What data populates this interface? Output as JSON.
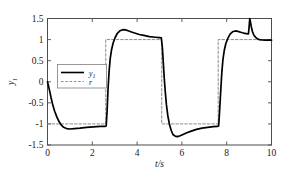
{
  "chart_data": {
    "type": "line",
    "title": "",
    "xlabel": "t/s",
    "ylabel": "y1",
    "xlim": [
      0,
      10
    ],
    "ylim": [
      -1.5,
      1.5
    ],
    "xticks": [
      "0",
      "2",
      "4",
      "6",
      "8",
      "10"
    ],
    "xtick_values": [
      0,
      2,
      4,
      6,
      8,
      10
    ],
    "yticks": [
      "1.5",
      "1",
      "0.5",
      "0",
      "-0.5",
      "-1",
      "-1.5"
    ],
    "ytick_values": [
      1.5,
      1,
      0.5,
      0,
      -0.5,
      -1,
      -1.5
    ],
    "grid": false,
    "legend_position": "center-left",
    "legend": [
      {
        "name": "y1",
        "style": "solid",
        "color": "#000000"
      },
      {
        "name": "r",
        "style": "dashed",
        "color": "#808080"
      }
    ],
    "series": [
      {
        "name": "y1",
        "style": "solid",
        "color": "#000000",
        "points": [
          [
            0.0,
            0.0
          ],
          [
            0.08,
            -0.18
          ],
          [
            0.16,
            -0.38
          ],
          [
            0.24,
            -0.56
          ],
          [
            0.32,
            -0.7
          ],
          [
            0.42,
            -0.84
          ],
          [
            0.52,
            -0.95
          ],
          [
            0.62,
            -1.03
          ],
          [
            0.72,
            -1.08
          ],
          [
            0.85,
            -1.11
          ],
          [
            1.0,
            -1.12
          ],
          [
            1.2,
            -1.11
          ],
          [
            1.45,
            -1.1
          ],
          [
            1.75,
            -1.08
          ],
          [
            2.05,
            -1.07
          ],
          [
            2.35,
            -1.06
          ],
          [
            2.56,
            -1.06
          ],
          [
            2.62,
            -1.05
          ],
          [
            2.66,
            -0.7
          ],
          [
            2.7,
            -0.2
          ],
          [
            2.75,
            0.25
          ],
          [
            2.8,
            0.55
          ],
          [
            2.86,
            0.76
          ],
          [
            2.93,
            0.92
          ],
          [
            3.02,
            1.05
          ],
          [
            3.12,
            1.15
          ],
          [
            3.24,
            1.21
          ],
          [
            3.36,
            1.235
          ],
          [
            3.48,
            1.23
          ],
          [
            3.6,
            1.21
          ],
          [
            3.75,
            1.18
          ],
          [
            3.92,
            1.15
          ],
          [
            4.1,
            1.12
          ],
          [
            4.3,
            1.1
          ],
          [
            4.55,
            1.07
          ],
          [
            4.8,
            1.055
          ],
          [
            5.0,
            1.045
          ],
          [
            5.08,
            1.04
          ],
          [
            5.13,
            0.8
          ],
          [
            5.17,
            0.45
          ],
          [
            5.21,
            0.1
          ],
          [
            5.26,
            -0.25
          ],
          [
            5.31,
            -0.55
          ],
          [
            5.37,
            -0.8
          ],
          [
            5.44,
            -1.0
          ],
          [
            5.52,
            -1.15
          ],
          [
            5.6,
            -1.25
          ],
          [
            5.7,
            -1.29
          ],
          [
            5.8,
            -1.3
          ],
          [
            5.92,
            -1.28
          ],
          [
            6.05,
            -1.25
          ],
          [
            6.22,
            -1.21
          ],
          [
            6.42,
            -1.17
          ],
          [
            6.65,
            -1.13
          ],
          [
            6.9,
            -1.1
          ],
          [
            7.15,
            -1.08
          ],
          [
            7.4,
            -1.065
          ],
          [
            7.58,
            -1.06
          ],
          [
            7.64,
            -1.05
          ],
          [
            7.68,
            -0.72
          ],
          [
            7.73,
            -0.25
          ],
          [
            7.78,
            0.2
          ],
          [
            7.83,
            0.52
          ],
          [
            7.89,
            0.74
          ],
          [
            7.96,
            0.9
          ],
          [
            8.05,
            1.03
          ],
          [
            8.15,
            1.13
          ],
          [
            8.26,
            1.185
          ],
          [
            8.38,
            1.205
          ],
          [
            8.5,
            1.195
          ],
          [
            8.62,
            1.175
          ],
          [
            8.75,
            1.155
          ],
          [
            8.88,
            1.14
          ],
          [
            8.97,
            1.135
          ],
          [
            9.0,
            1.3
          ],
          [
            9.03,
            1.5
          ],
          [
            9.06,
            1.42
          ],
          [
            9.1,
            1.3
          ],
          [
            9.15,
            1.19
          ],
          [
            9.21,
            1.11
          ],
          [
            9.28,
            1.06
          ],
          [
            9.36,
            1.02
          ],
          [
            9.46,
            1.0
          ],
          [
            9.58,
            0.99
          ],
          [
            9.72,
            0.985
          ],
          [
            9.86,
            0.985
          ],
          [
            10.0,
            0.985
          ]
        ]
      },
      {
        "name": "r",
        "style": "dashed",
        "color": "#808080",
        "points": [
          [
            0.0,
            -1.0
          ],
          [
            2.6,
            -1.0
          ],
          [
            2.6,
            1.0
          ],
          [
            5.1,
            1.0
          ],
          [
            5.1,
            -1.0
          ],
          [
            7.62,
            -1.0
          ],
          [
            7.62,
            1.0
          ],
          [
            10.0,
            1.0
          ]
        ]
      }
    ]
  }
}
